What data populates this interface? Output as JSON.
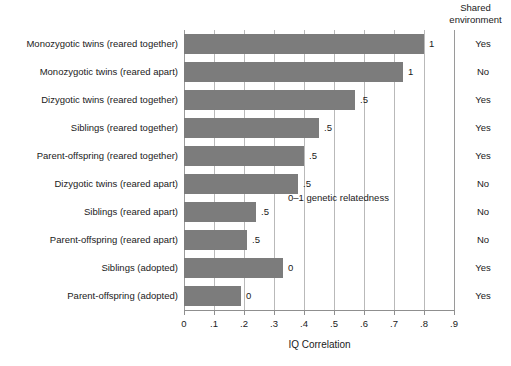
{
  "figure": {
    "right_column_header_line1": "Shared",
    "right_column_header_line2": "environment",
    "annotation": "0–1 genetic relatedness"
  },
  "chart_data": {
    "type": "bar",
    "orientation": "horizontal",
    "title": "",
    "xlabel": "IQ Correlation",
    "ylabel": "",
    "xlim": [
      0,
      0.9
    ],
    "grid": true,
    "legend": null,
    "bar_color": "#7c7c7c",
    "annotations": [
      "0–1 genetic relatedness"
    ],
    "xticks": [
      0,
      0.1,
      0.2,
      0.3,
      0.4,
      0.5,
      0.6,
      0.7,
      0.8,
      0.9
    ],
    "xticklabels": [
      "0",
      ".1",
      ".2",
      ".3",
      ".4",
      ".5",
      ".6",
      ".7",
      ".8",
      ".9"
    ],
    "categories": [
      "Monozygotic twins (reared together)",
      "Monozygotic twins (reared apart)",
      "Dizygotic twins (reared together)",
      "Siblings (reared together)",
      "Parent-offspring (reared together)",
      "Dizygotic twins (reared apart)",
      "Siblings (reared apart)",
      "Parent-offspring (reared apart)",
      "Siblings (adopted)",
      "Parent-offspring (adopted)"
    ],
    "values": [
      0.8,
      0.73,
      0.57,
      0.45,
      0.4,
      0.38,
      0.24,
      0.21,
      0.33,
      0.19
    ],
    "point_labels": [
      "1",
      "1",
      ".5",
      ".5",
      ".5",
      ".5",
      ".5",
      ".5",
      "0",
      "0"
    ],
    "point_label_name": "genetic relatedness",
    "shared_environment_header": "Shared environment",
    "shared_environment": [
      "Yes",
      "No",
      "Yes",
      "Yes",
      "Yes",
      "No",
      "No",
      "No",
      "Yes",
      "Yes"
    ]
  }
}
